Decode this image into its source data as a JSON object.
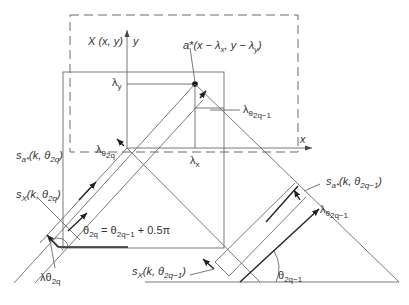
{
  "diagram": {
    "labels": {
      "function_X": "X (x, y)",
      "axis_y": "y",
      "axis_x": "x",
      "point_a_star": "a*(x − λ",
      "point_a_star_sub_x": "x",
      "point_a_star_mid": ", y − λ",
      "point_a_star_sub_y": "y",
      "point_a_star_end": ")",
      "lambda": "λ",
      "lambda_y_sub": "y",
      "lambda_x_sub": "x",
      "lambda_theta_2q_1_sub": "θ",
      "lambda_theta_2q_1_subsub": "2q−1",
      "lambda_theta_2q_sub": "θ",
      "lambda_theta_2q_subsub": "2q",
      "s_a_theta_2q": "s",
      "s_a_sub": "a*",
      "s_args_2q": "(k, θ",
      "s_args_2q_sub": "2q",
      "s_args_end": ")",
      "s_X_sub": "X",
      "s_args_2q_1_sub": "2q−1",
      "theta_equation_lhs": "θ",
      "theta_equation_lhs_sub": "2q",
      "theta_equation_eq": " = θ",
      "theta_equation_rhs_sub": "2q−1",
      "theta_equation_tail": " + 0.5π",
      "lambda_theta_2q_bottom": "λθ",
      "lambda_theta_2q_bottom_sub": "2q",
      "theta_angle": "θ",
      "theta_angle_sub": "2q−1"
    }
  }
}
